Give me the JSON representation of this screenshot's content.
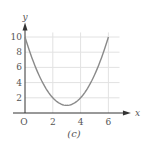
{
  "chart_data": {
    "type": "line",
    "title": "",
    "caption": "(c)",
    "xlabel": "x",
    "ylabel": "y",
    "origin_label": "O",
    "xlim": [
      0,
      6.9
    ],
    "ylim": [
      0,
      11.5
    ],
    "x_ticks": [
      2,
      4,
      6
    ],
    "x_tick_labels": [
      "2",
      "4",
      "6"
    ],
    "y_ticks": [
      2,
      4,
      6,
      8,
      10
    ],
    "y_tick_labels": [
      "2",
      "4",
      "6",
      "8",
      "10"
    ],
    "grid": true,
    "legend": null,
    "series": [
      {
        "name": "curve",
        "color": "#8a8a8a",
        "x": [
          0,
          0.5,
          1,
          1.5,
          2,
          2.5,
          3,
          3.5,
          4,
          4.5,
          5,
          5.5,
          6
        ],
        "y": [
          10,
          7.25,
          5,
          3.25,
          2,
          1.25,
          1,
          1.25,
          2,
          3.25,
          5,
          7.25,
          10
        ]
      }
    ]
  },
  "colors": {
    "axis": "#333333",
    "grid": "#e2e2e2",
    "curve": "#8a8a8a",
    "text": "#555555"
  }
}
